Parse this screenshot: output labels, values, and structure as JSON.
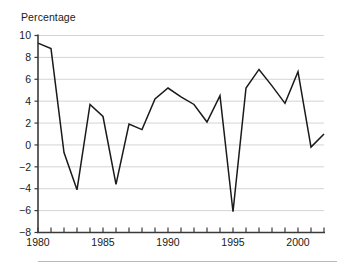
{
  "chart": {
    "title": "Percentage",
    "axis_color": "#3a3a3a",
    "gridline_color": "#d4d4d4",
    "line_color": "#1a1a1a",
    "background_color": "#ffffff",
    "footer_rule_color": "#b9b9b9"
  },
  "chart_data": {
    "type": "line",
    "title": "Percentage",
    "xlabel": "",
    "ylabel": "",
    "ylim": [
      -8,
      10
    ],
    "xlim": [
      1980,
      2002
    ],
    "yticks": [
      -8,
      -6,
      -4,
      -2,
      0,
      2,
      4,
      6,
      8,
      10
    ],
    "ytick_labels": [
      "-8",
      "-6",
      "-4",
      "-2",
      "0",
      "2",
      "4",
      "6",
      "8",
      "10"
    ],
    "xticks": [
      1980,
      1981,
      1982,
      1983,
      1984,
      1985,
      1986,
      1987,
      1988,
      1989,
      1990,
      1991,
      1992,
      1993,
      1994,
      1995,
      1996,
      1997,
      1998,
      1999,
      2000,
      2001,
      2002
    ],
    "xtick_labels_shown": [
      "1980",
      "1985",
      "1990",
      "1995",
      "2000"
    ],
    "xtick_labels_shown_at": [
      1980,
      1985,
      1990,
      1995,
      2000
    ],
    "grid": "horizontal",
    "legend": "none",
    "x": [
      1980,
      1981,
      1982,
      1983,
      1984,
      1985,
      1986,
      1987,
      1988,
      1989,
      1990,
      1991,
      1992,
      1993,
      1994,
      1995,
      1996,
      1997,
      1998,
      1999,
      2000,
      2001,
      2002
    ],
    "values": [
      9.3,
      8.8,
      -0.7,
      -4.1,
      3.7,
      2.6,
      -3.6,
      1.9,
      1.4,
      4.2,
      5.2,
      4.4,
      3.7,
      2.1,
      4.5,
      -6.1,
      5.2,
      6.9,
      5.4,
      3.8,
      6.7,
      -0.2,
      1.0
    ],
    "series": [
      {
        "name": "Percentage",
        "values": [
          9.3,
          8.8,
          -0.7,
          -4.1,
          3.7,
          2.6,
          -3.6,
          1.9,
          1.4,
          4.2,
          5.2,
          4.4,
          3.7,
          2.1,
          4.5,
          -6.1,
          5.2,
          6.9,
          5.4,
          3.8,
          6.7,
          -0.2,
          1.0
        ]
      }
    ]
  }
}
